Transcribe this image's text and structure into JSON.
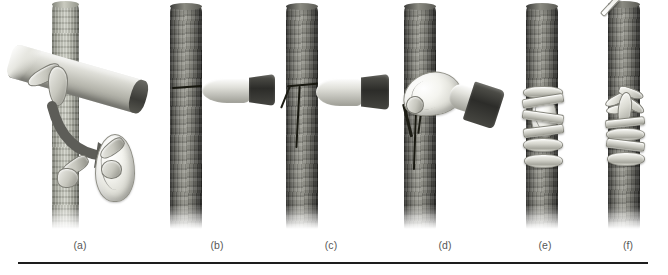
{
  "figure": {
    "background_color": "#ffffff",
    "rule_color": "#1d1d1d",
    "caption_color": "#575757",
    "bark_color": "#6f6f68",
    "budstick_color": "#d9d9d2",
    "knife_handle_color": "#2c2c29",
    "cut_color": "#17170f",
    "wrap_color": "#d6d6ce"
  },
  "panels": [
    {
      "id": "panel-a",
      "label": "(a)",
      "description": "Bud being sliced from the budstick; arrow points to the detached bud shield"
    },
    {
      "id": "panel-b",
      "label": "(b)",
      "description": "Horizontal cut made across the bark of the rootstock with the knife"
    },
    {
      "id": "panel-c",
      "label": "(c)",
      "description": "Vertical cut completing the T-shaped incision in the rootstock bark"
    },
    {
      "id": "panel-d",
      "label": "(d)",
      "description": "Bark flaps of the T-cut lifted open with the knife blade"
    },
    {
      "id": "panel-e",
      "label": "(e)",
      "description": "Bud shield inserted under the bark flaps and wrapped with budding tape"
    },
    {
      "id": "panel-f",
      "label": "(f)",
      "description": "Completed graft with the bud pushing out a new shoot above the wrap"
    }
  ]
}
